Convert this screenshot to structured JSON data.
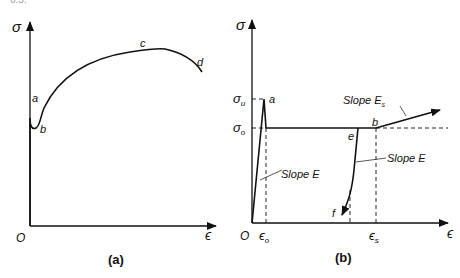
{
  "header_fragment": "6.5.",
  "panel_a": {
    "caption": "(a)",
    "y_axis_label": "σ",
    "x_axis_label": "ϵ",
    "origin_label": "O",
    "points": {
      "a": "a",
      "b": "b",
      "c": "c",
      "d": "d"
    }
  },
  "panel_b": {
    "caption": "(b)",
    "y_axis_label": "σ",
    "x_axis_label": "ϵ",
    "origin_label": "O",
    "sigma_u": "σ",
    "sigma_u_sub": "u",
    "sigma_o": "σ",
    "sigma_o_sub": "o",
    "eps_o": "ϵ",
    "eps_o_sub": "o",
    "eps_s": "ϵ",
    "eps_s_sub": "s",
    "points": {
      "a": "a",
      "b": "b",
      "e": "e",
      "f": "f"
    },
    "slope_E_left": "Slope E",
    "slope_E_right": "Slope E",
    "slope_Es": "Slope E",
    "slope_Es_sub": "s"
  },
  "colors": {
    "ink": "#111111",
    "background": "#ffffff"
  }
}
